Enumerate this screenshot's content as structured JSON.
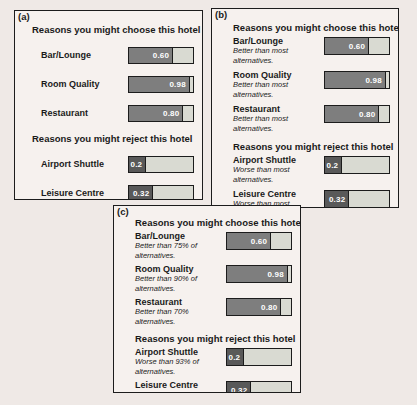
{
  "figure": {
    "description_colors": {
      "page_bg": "#efe9e6",
      "panel_bg": "#f6f1ee",
      "border": "#1c1c1c",
      "bar_track": "#d9dad2",
      "choose_fill": "#7e7e7e",
      "reject_fill": "#595959",
      "value_text": "#ffffff"
    }
  },
  "panels": [
    {
      "tag": "(a)",
      "choose_title": "Reasons you might choose this hotel",
      "reject_title": "Reasons you might reject this hotel",
      "choose_items": [
        {
          "label": "Bar/Lounge",
          "value": "0.60",
          "fill_pct": 69
        },
        {
          "label": "Room Quality",
          "value": "0.98",
          "fill_pct": 95
        },
        {
          "label": "Restaurant",
          "value": "0.80",
          "fill_pct": 85
        }
      ],
      "reject_items": [
        {
          "label": "Airport Shuttle",
          "value": "0.2",
          "fill_pct": 27
        },
        {
          "label": "Leisure Centre",
          "value": "0.32",
          "fill_pct": 38
        }
      ]
    },
    {
      "tag": "(b)",
      "choose_title": "Reasons you might choose this hotel",
      "reject_title": "Reasons you might reject this hotel",
      "choose_items": [
        {
          "label": "Bar/Lounge",
          "subtitle": "Better than most alternatives.",
          "value": "0.60",
          "fill_pct": 69
        },
        {
          "label": "Room Quality",
          "subtitle": "Better than most alternatives.",
          "value": "0.98",
          "fill_pct": 95
        },
        {
          "label": "Restaurant",
          "subtitle": "Better than most alternatives.",
          "value": "0.80",
          "fill_pct": 85
        }
      ],
      "reject_items": [
        {
          "label": "Airport Shuttle",
          "subtitle": "Worse than most alternatives.",
          "value": "0.2",
          "fill_pct": 27
        },
        {
          "label": "Leisure Centre",
          "subtitle": "Worse than most alternatives.",
          "value": "0.32",
          "fill_pct": 38
        }
      ]
    },
    {
      "tag": "(c)",
      "choose_title": "Reasons you might choose this hotel",
      "reject_title": "Reasons you might reject this hotel",
      "choose_items": [
        {
          "label": "Bar/Lounge",
          "subtitle": "Better than 75% of alternatives.",
          "value": "0.60",
          "fill_pct": 69
        },
        {
          "label": "Room Quality",
          "subtitle": "Better than 90% of alternatives.",
          "value": "0.98",
          "fill_pct": 95
        },
        {
          "label": "Restaurant",
          "subtitle": "Better than 70% alternatives.",
          "value": "0.80",
          "fill_pct": 85
        }
      ],
      "reject_items": [
        {
          "label": "Airport Shuttle",
          "subtitle": "Worse than 93% of alternatives.",
          "value": "0.2",
          "fill_pct": 27
        },
        {
          "label": "Leisure Centre",
          "subtitle": "Worse than 80% of alternatives.",
          "value": "0.32",
          "fill_pct": 38
        }
      ]
    }
  ],
  "chart_data": [
    {
      "type": "bar",
      "panel": "(a)",
      "orientation": "horizontal",
      "xlim": [
        0,
        1
      ],
      "sections": [
        {
          "title": "Reasons you might choose this hotel",
          "categories": [
            "Bar/Lounge",
            "Room Quality",
            "Restaurant"
          ],
          "values": [
            0.6,
            0.98,
            0.8
          ]
        },
        {
          "title": "Reasons you might reject this hotel",
          "categories": [
            "Airport Shuttle",
            "Leisure Centre"
          ],
          "values": [
            0.2,
            0.32
          ]
        }
      ]
    },
    {
      "type": "bar",
      "panel": "(b)",
      "orientation": "horizontal",
      "xlim": [
        0,
        1
      ],
      "sections": [
        {
          "title": "Reasons you might choose this hotel",
          "categories": [
            "Bar/Lounge",
            "Room Quality",
            "Restaurant"
          ],
          "values": [
            0.6,
            0.98,
            0.8
          ],
          "annotations": [
            "Better than most alternatives.",
            "Better than most alternatives.",
            "Better than most alternatives."
          ]
        },
        {
          "title": "Reasons you might reject this hotel",
          "categories": [
            "Airport Shuttle",
            "Leisure Centre"
          ],
          "values": [
            0.2,
            0.32
          ],
          "annotations": [
            "Worse than most alternatives.",
            "Worse than most alternatives."
          ]
        }
      ]
    },
    {
      "type": "bar",
      "panel": "(c)",
      "orientation": "horizontal",
      "xlim": [
        0,
        1
      ],
      "sections": [
        {
          "title": "Reasons you might choose this hotel",
          "categories": [
            "Bar/Lounge",
            "Room Quality",
            "Restaurant"
          ],
          "values": [
            0.6,
            0.98,
            0.8
          ],
          "annotations": [
            "Better than 75% of alternatives.",
            "Better than 90% of alternatives.",
            "Better than 70% alternatives."
          ]
        },
        {
          "title": "Reasons you might reject this hotel",
          "categories": [
            "Airport Shuttle",
            "Leisure Centre"
          ],
          "values": [
            0.2,
            0.32
          ],
          "annotations": [
            "Worse than 93% of alternatives.",
            "Worse than 80% of alternatives."
          ]
        }
      ]
    }
  ]
}
